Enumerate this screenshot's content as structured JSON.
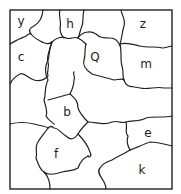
{
  "diagram": {
    "type": "map-regions",
    "regions": [
      {
        "id": "y",
        "label": "y",
        "x": 21,
        "y": 21
      },
      {
        "id": "h",
        "label": "h",
        "x": 70,
        "y": 24
      },
      {
        "id": "z",
        "label": "z",
        "x": 143,
        "y": 24
      },
      {
        "id": "c",
        "label": "c",
        "x": 21,
        "y": 57
      },
      {
        "id": "Q",
        "label": "Q",
        "x": 95,
        "y": 57
      },
      {
        "id": "m",
        "label": "m",
        "x": 146,
        "y": 64
      },
      {
        "id": "b",
        "label": "b",
        "x": 67,
        "y": 112
      },
      {
        "id": "e",
        "label": "e",
        "x": 148,
        "y": 133
      },
      {
        "id": "f",
        "label": "f",
        "x": 56,
        "y": 154
      },
      {
        "id": "k",
        "label": "k",
        "x": 142,
        "y": 170
      }
    ]
  }
}
